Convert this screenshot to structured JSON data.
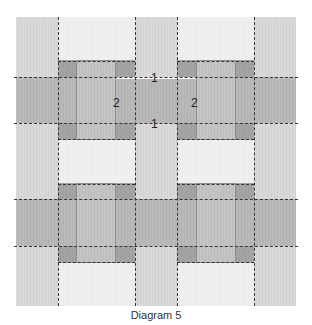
{
  "diagram": {
    "caption": "Diagram 5",
    "labels": {
      "top_seam": "1",
      "bottom_seam": "1",
      "left_strip": "2",
      "right_strip": "2"
    },
    "colors": {
      "light": "#d8d8d8",
      "very_light": "#f0f0f0",
      "medium": "#b5b5b5",
      "strip": "#c0c0c0",
      "dark": "#a0a0a0",
      "seam_line": "#333333"
    }
  }
}
